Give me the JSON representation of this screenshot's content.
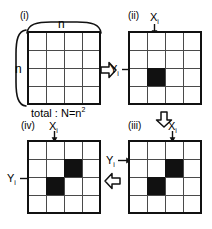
{
  "figure": {
    "background_color": "#ffffff",
    "ink_color": "#111111",
    "gridline_color": "#4a4a4a"
  },
  "panels": [
    {
      "tag": "(i)",
      "grid": {
        "rows": 4,
        "cols": 4
      },
      "filled_cells": [],
      "labels": {
        "top_n": "n",
        "left_n": "n",
        "total_prefix": "total : N=n",
        "total_exponent": "2"
      }
    },
    {
      "tag": "(ii)",
      "grid": {
        "rows": 4,
        "cols": 4
      },
      "filled_cells": [
        {
          "row": 2,
          "col": 1
        }
      ],
      "labels": {
        "x_main": "X",
        "x_sub": "i",
        "y_main": "Y",
        "y_sub": "i"
      }
    },
    {
      "tag": "(iii)",
      "grid": {
        "rows": 4,
        "cols": 4
      },
      "filled_cells": [
        {
          "row": 1,
          "col": 2
        },
        {
          "row": 2,
          "col": 1
        }
      ],
      "labels": {
        "x_main": "X",
        "x_sub": "i",
        "y_main": "Y",
        "y_sub": "i"
      }
    },
    {
      "tag": "(iv)",
      "grid": {
        "rows": 4,
        "cols": 4
      },
      "filled_cells": [
        {
          "row": 1,
          "col": 2
        },
        {
          "row": 2,
          "col": 1
        }
      ],
      "labels": {
        "x_main": "X",
        "x_sub": "i",
        "y_main": "Y",
        "y_sub": "i"
      }
    }
  ],
  "flow_arrows": [
    {
      "name": "arrow-i-to-ii",
      "direction": "right"
    },
    {
      "name": "arrow-ii-to-iii",
      "direction": "down"
    },
    {
      "name": "arrow-iii-to-iv",
      "direction": "left"
    }
  ]
}
